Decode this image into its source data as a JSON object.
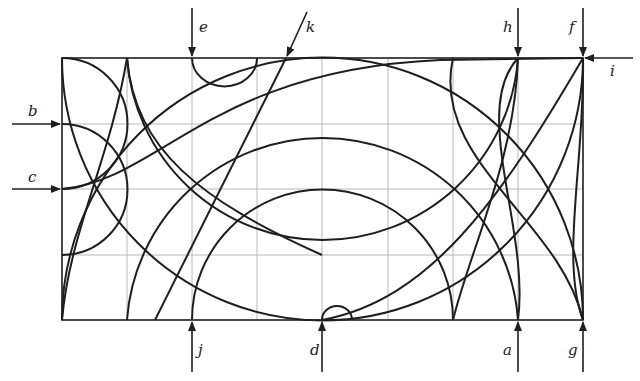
{
  "diagram": {
    "type": "arc-maze-grid",
    "grid": {
      "columns": 8,
      "rows": 4,
      "origin_px": [
        62,
        320
      ],
      "unit_px": 65.1
    },
    "colors": {
      "grid": "#b8b8b8",
      "curve": "#1e1e1e",
      "frame": "#1e1e1e",
      "text": "#222222"
    },
    "entry_arrows": [
      {
        "id": "a",
        "label": "a",
        "side": "bottom",
        "x": 518,
        "direction": "up"
      },
      {
        "id": "b",
        "label": "b",
        "side": "left",
        "y": 124,
        "direction": "right"
      },
      {
        "id": "c",
        "label": "c",
        "side": "left",
        "y": 189,
        "direction": "right"
      },
      {
        "id": "d",
        "label": "d",
        "side": "bottom",
        "x": 322,
        "direction": "up"
      },
      {
        "id": "e",
        "label": "e",
        "side": "top",
        "x": 192,
        "direction": "down"
      },
      {
        "id": "f",
        "label": "f",
        "side": "top",
        "x": 583,
        "direction": "down"
      },
      {
        "id": "g",
        "label": "g",
        "side": "bottom",
        "x": 583,
        "direction": "up"
      },
      {
        "id": "h",
        "label": "h",
        "side": "top",
        "x": 518,
        "direction": "down"
      },
      {
        "id": "i",
        "label": "i",
        "side": "right",
        "y": 58,
        "direction": "left"
      },
      {
        "id": "j",
        "label": "j",
        "side": "bottom",
        "x": 192,
        "direction": "up"
      },
      {
        "id": "k",
        "label": "k",
        "side": "top",
        "x": 286,
        "direction": "down-left"
      }
    ]
  }
}
